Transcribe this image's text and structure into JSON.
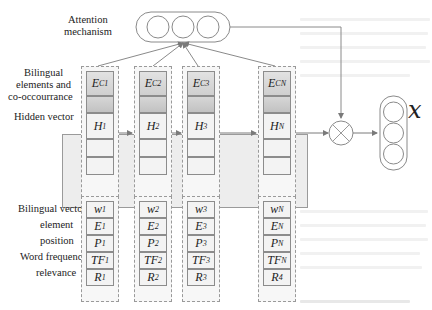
{
  "labels": {
    "attention": "Attention mechanism",
    "attention_l1": "Attention",
    "attention_l2": "mechanism",
    "bilingual_l1": "Bilingual",
    "bilingual_l2": "elements and",
    "bilingual_l3": "co-occourrance",
    "hidden": "Hidden vector",
    "bvec": "Bilingual vector",
    "element": "element",
    "position": "position",
    "wordfreq": "Word frequency",
    "relevance": "relevance",
    "output": "x"
  },
  "columns": [
    {
      "ec": "E",
      "ec_sub": "C1",
      "h": "H",
      "h_sub": "1",
      "w": "w",
      "w_sub": "1",
      "e": "E",
      "e_sub": "1",
      "p": "P",
      "p_sub": "1",
      "tf": "TF",
      "tf_sub": "1",
      "r": "R",
      "r_sub": "1"
    },
    {
      "ec": "E",
      "ec_sub": "C2",
      "h": "H",
      "h_sub": "2",
      "w": "w",
      "w_sub": "2",
      "e": "E",
      "e_sub": "2",
      "p": "P",
      "p_sub": "2",
      "tf": "TF",
      "tf_sub": "2",
      "r": "R",
      "r_sub": "2"
    },
    {
      "ec": "E",
      "ec_sub": "C3",
      "h": "H",
      "h_sub": "3",
      "w": "w",
      "w_sub": "3",
      "e": "E",
      "e_sub": "3",
      "p": "P",
      "p_sub": "3",
      "tf": "TF",
      "tf_sub": "3",
      "r": "R",
      "r_sub": "3"
    },
    {
      "ec": "E",
      "ec_sub": "CN",
      "h": "H",
      "h_sub": "N",
      "w": "w",
      "w_sub": "N",
      "e": "E",
      "e_sub": "N",
      "p": "P",
      "p_sub": "N",
      "tf": "TF",
      "tf_sub": "N",
      "r": "R",
      "r_sub": "4"
    }
  ],
  "nodes": {
    "attention_circles": 3,
    "output_circles": 3,
    "combine_op": "multiply (⊗)"
  },
  "colors": {
    "line": "#7a7a7a",
    "dashed_border": "#9a9a9a",
    "cell_fill": "#f3f3f3",
    "gradient_cell": "#cfcfcf"
  }
}
